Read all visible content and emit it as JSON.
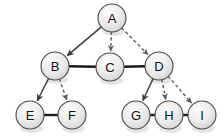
{
  "diagram": {
    "width": 224,
    "height": 136,
    "background_color": "#ffffff",
    "node_fill_color": "#ededed",
    "node_stroke_color": "#4a4a4a",
    "node_label_color": "#111111",
    "solid_edge_color": "#1b1b1b",
    "arrow_solid_color": "#3d3d3d",
    "arrow_dashed_color": "#5a5a5a",
    "node_radius": 14
  },
  "nodes": [
    {
      "id": "A",
      "label": "A",
      "x": 112,
      "y": 18
    },
    {
      "id": "B",
      "label": "B",
      "x": 55,
      "y": 66
    },
    {
      "id": "C",
      "label": "C",
      "x": 110,
      "y": 67
    },
    {
      "id": "D",
      "label": "D",
      "x": 159,
      "y": 66
    },
    {
      "id": "E",
      "label": "E",
      "x": 30,
      "y": 115
    },
    {
      "id": "F",
      "label": "F",
      "x": 72,
      "y": 115
    },
    {
      "id": "G",
      "label": "G",
      "x": 136,
      "y": 115
    },
    {
      "id": "H",
      "label": "H",
      "x": 169,
      "y": 115
    },
    {
      "id": "I",
      "label": "I",
      "x": 202,
      "y": 115
    }
  ],
  "edges": [
    {
      "from": "A",
      "to": "B",
      "style": "solid",
      "directed": true
    },
    {
      "from": "A",
      "to": "C",
      "style": "dashed",
      "directed": true
    },
    {
      "from": "A",
      "to": "D",
      "style": "dashed",
      "directed": true
    },
    {
      "from": "B",
      "to": "E",
      "style": "solid",
      "directed": true
    },
    {
      "from": "B",
      "to": "F",
      "style": "dashed",
      "directed": true
    },
    {
      "from": "D",
      "to": "G",
      "style": "solid",
      "directed": true
    },
    {
      "from": "D",
      "to": "H",
      "style": "dashed",
      "directed": true
    },
    {
      "from": "D",
      "to": "I",
      "style": "dashed",
      "directed": true
    },
    {
      "from": "B",
      "to": "C",
      "style": "solid",
      "directed": false
    },
    {
      "from": "C",
      "to": "D",
      "style": "solid",
      "directed": false
    },
    {
      "from": "E",
      "to": "F",
      "style": "solid",
      "directed": false
    },
    {
      "from": "G",
      "to": "H",
      "style": "solid",
      "directed": false
    },
    {
      "from": "H",
      "to": "I",
      "style": "solid",
      "directed": false
    }
  ]
}
